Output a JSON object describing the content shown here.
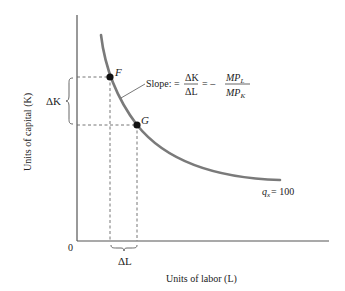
{
  "diagram": {
    "axes": {
      "x_label": "Units of labor (L)",
      "y_label": "Units of capital (K)",
      "origin_label": "0"
    },
    "points": [
      {
        "id": "F",
        "label": "F"
      },
      {
        "id": "G",
        "label": "G"
      }
    ],
    "curve_label": {
      "q": "q",
      "sub": "x",
      "value": "= 100"
    },
    "delta_k_label": "ΔK",
    "delta_l_label": "ΔL",
    "slope_annotation": {
      "prefix": "Slope: =",
      "frac1_num": "ΔK",
      "frac1_den": "ΔL",
      "equals": "= –",
      "frac2_num": "MP",
      "frac2_num_sub": "L",
      "frac2_den": "MP",
      "frac2_den_sub": "K"
    },
    "colors": {
      "curve": "#7a7a7a",
      "axis": "#555555",
      "dash": "#666666",
      "point": "#111111"
    }
  }
}
